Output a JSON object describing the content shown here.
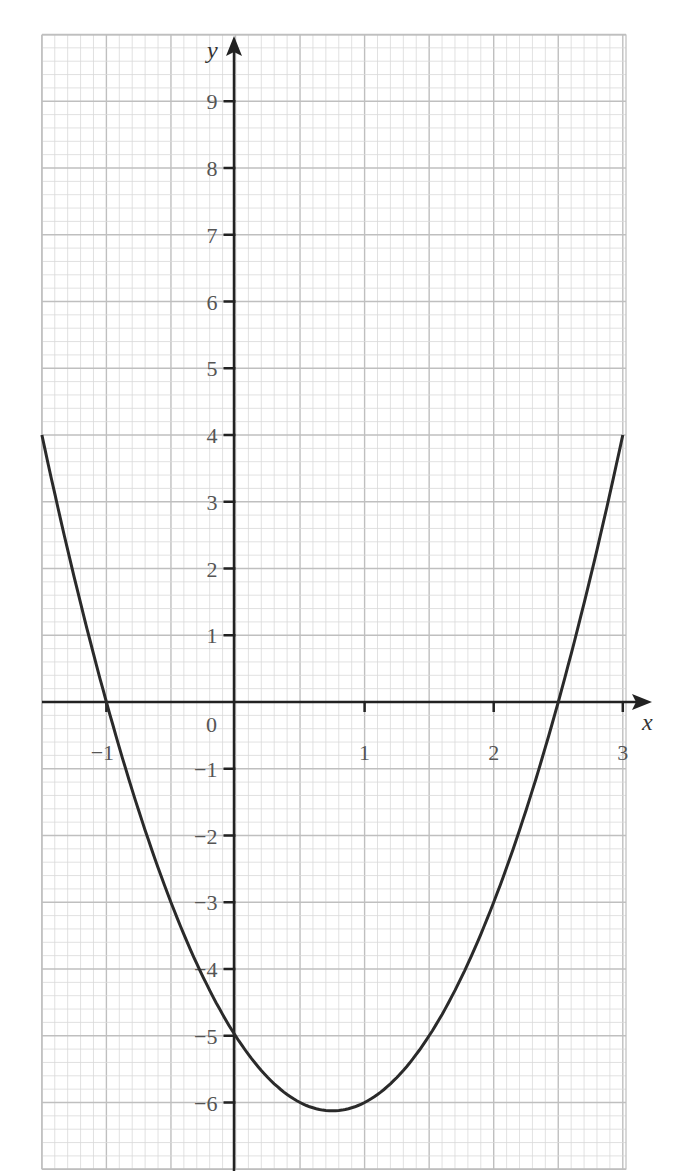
{
  "chart_data": {
    "type": "line",
    "title": "",
    "function": "y = 2x^2 - 3x - 5",
    "xlabel": "x",
    "ylabel": "y",
    "xlim": [
      -1.5,
      3
    ],
    "ylim": [
      -7,
      10
    ],
    "grid": true,
    "x_ticks": [
      -1,
      0,
      1,
      2,
      3
    ],
    "x_tick_labels": [
      "-1",
      "0",
      "1",
      "2",
      "3"
    ],
    "y_ticks": [
      -6,
      -5,
      -4,
      -3,
      -2,
      -1,
      1,
      2,
      3,
      4,
      5,
      6,
      7,
      8,
      9
    ],
    "y_tick_labels": [
      "−6",
      "−5",
      "−4",
      "−3",
      "−2",
      "−1",
      "1",
      "2",
      "3",
      "4",
      "5",
      "6",
      "7",
      "8",
      "9"
    ],
    "origin_label": "0",
    "series": [
      {
        "name": "curve",
        "x": [
          -1.5,
          -1.25,
          -1.0,
          -0.75,
          -0.5,
          -0.25,
          0,
          0.25,
          0.5,
          0.75,
          1.0,
          1.25,
          1.5,
          1.75,
          2.0,
          2.25,
          2.5,
          2.75,
          3.0
        ],
        "y": [
          4,
          1.875,
          0,
          -1.625,
          -3,
          -4.125,
          -5,
          -5.625,
          -6,
          -6.125,
          -6,
          -5.625,
          -5,
          -4.125,
          -3,
          -1.625,
          0,
          1.875,
          4
        ]
      }
    ],
    "annotations": {
      "roots": [
        -1,
        2.5
      ],
      "y_intercept": -5,
      "minimum": [
        0.75,
        -6.125
      ]
    }
  },
  "colors": {
    "grid_minor": "#d9d9d9",
    "grid_major": "#bfbfbf",
    "axis": "#222222",
    "curve": "#2a2a2a",
    "label": "#555555"
  }
}
